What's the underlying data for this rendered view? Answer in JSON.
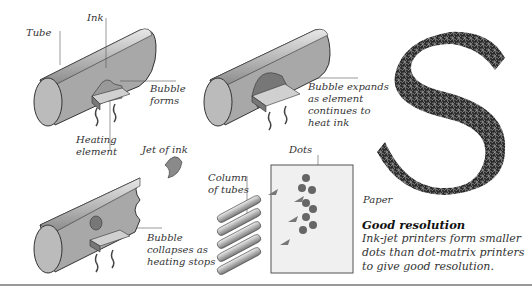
{
  "diagram": {
    "stage1": {
      "labels": {
        "tube": "Tube",
        "ink": "Ink",
        "bubble_forms": "Bubble\nforms",
        "heating_element": "Heating\nelement"
      }
    },
    "stage2": {
      "labels": {
        "bubble_expands": "Bubble expands\nas element\ncontinues to\nheat ink"
      }
    },
    "stage3": {
      "labels": {
        "jet_of_ink": "Jet of ink",
        "bubble_collapses": "Bubble\ncollapses as\nheating stops"
      }
    },
    "paper_panel": {
      "labels": {
        "column_of_tubes": "Column\nof tubes",
        "dots": "Dots",
        "paper": "Paper"
      }
    },
    "letter_sample": {
      "glyph": "S"
    },
    "caption": {
      "title": "Good resolution",
      "body": "Ink-jet printers form smaller dots than dot-matrix printers to give good resolution."
    }
  }
}
